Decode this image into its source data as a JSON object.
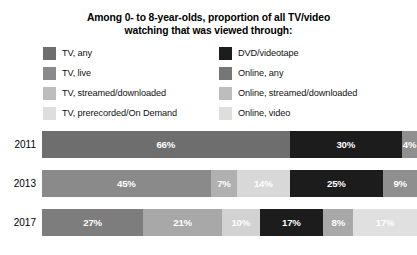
{
  "title": {
    "line1": "Among 0- to 8-year-olds, proportion of all TV/video",
    "line2": "watching that was viewed through:"
  },
  "legend": {
    "left": [
      {
        "label": "TV, any",
        "color": "#6e6e6e",
        "swatch_name": "legend-swatch-tv-any"
      },
      {
        "label": "TV, live",
        "color": "#8a8a8a",
        "swatch_name": "legend-swatch-tv-live"
      },
      {
        "label": "TV, streamed/downloaded",
        "color": "#bdbdbd",
        "swatch_name": "legend-swatch-tv-streamed"
      },
      {
        "label": "TV, prerecorded/On Demand",
        "color": "#dedede",
        "swatch_name": "legend-swatch-tv-prerecorded"
      }
    ],
    "right": [
      {
        "label": "DVD/videotape",
        "color": "#1c1c1c",
        "swatch_name": "legend-swatch-dvd"
      },
      {
        "label": "Online, any",
        "color": "#767676",
        "swatch_name": "legend-swatch-online-any"
      },
      {
        "label": "Online, streamed/downloaded",
        "color": "#bdbdbd",
        "swatch_name": "legend-swatch-online-streamed"
      },
      {
        "label": "Online, video",
        "color": "#dedede",
        "swatch_name": "legend-swatch-online-video"
      }
    ]
  },
  "chart_data": {
    "type": "bar",
    "subtype": "stacked-horizontal-100",
    "title": "Among 0- to 8-year-olds, proportion of all TV/video watching that was viewed through:",
    "xlabel": "",
    "ylabel": "",
    "xlim": [
      0,
      100
    ],
    "grid": false,
    "legend_position": "top",
    "categories": [
      "2011",
      "2013",
      "2017"
    ],
    "series": [
      {
        "name": "TV, any",
        "color": "#6e6e6e",
        "values": [
          66,
          null,
          null
        ]
      },
      {
        "name": "TV, live",
        "color": "#8a8a8a",
        "values": [
          null,
          45,
          27
        ]
      },
      {
        "name": "TV, streamed/downloaded",
        "color": "#bdbdbd",
        "values": [
          null,
          7,
          21
        ]
      },
      {
        "name": "TV, prerecorded/On Demand",
        "color": "#dedede",
        "values": [
          null,
          14,
          10
        ]
      },
      {
        "name": "DVD/videotape",
        "color": "#1c1c1c",
        "values": [
          30,
          25,
          17
        ]
      },
      {
        "name": "Online, any",
        "color": "#767676",
        "values": [
          4,
          9,
          8
        ]
      },
      {
        "name": "Online, video",
        "color": "#dedede",
        "values": [
          null,
          null,
          17
        ]
      }
    ],
    "rows": [
      {
        "year": "2011",
        "segments": [
          {
            "label": "66%",
            "value": 66,
            "color": "#6e6e6e",
            "series": "TV, any",
            "text_color": "#ffffff"
          },
          {
            "label": "30%",
            "value": 30,
            "color": "#1c1c1c",
            "series": "DVD/videotape",
            "text_color": "#ffffff"
          },
          {
            "label": "4%",
            "value": 4,
            "color": "#8f8f8f",
            "series": "Online, any",
            "text_color": "#ffffff"
          }
        ]
      },
      {
        "year": "2013",
        "segments": [
          {
            "label": "45%",
            "value": 45,
            "color": "#8a8a8a",
            "series": "TV, live",
            "text_color": "#ffffff"
          },
          {
            "label": "7%",
            "value": 7,
            "color": "#b0b0b0",
            "series": "TV, streamed/downloaded",
            "text_color": "#ffffff"
          },
          {
            "label": "14%",
            "value": 14,
            "color": "#d8d8d8",
            "series": "TV, prerecorded/On Demand",
            "text_color": "#ffffff"
          },
          {
            "label": "25%",
            "value": 25,
            "color": "#1c1c1c",
            "series": "DVD/videotape",
            "text_color": "#ffffff"
          },
          {
            "label": "9%",
            "value": 9,
            "color": "#8f8f8f",
            "series": "Online, any",
            "text_color": "#ffffff"
          }
        ]
      },
      {
        "year": "2017",
        "segments": [
          {
            "label": "27%",
            "value": 27,
            "color": "#7d7d7d",
            "series": "TV, live",
            "text_color": "#ffffff"
          },
          {
            "label": "21%",
            "value": 21,
            "color": "#a8a8a8",
            "series": "TV, streamed/downloaded",
            "text_color": "#ffffff"
          },
          {
            "label": "10%",
            "value": 10,
            "color": "#d2d2d2",
            "series": "TV, prerecorded/On Demand",
            "text_color": "#ffffff"
          },
          {
            "label": "17%",
            "value": 17,
            "color": "#1c1c1c",
            "series": "DVD/videotape",
            "text_color": "#ffffff"
          },
          {
            "label": "8%",
            "value": 8,
            "color": "#a8a8a8",
            "series": "Online, any",
            "text_color": "#ffffff"
          },
          {
            "label": "17%",
            "value": 17,
            "color": "#e0e0e0",
            "series": "Online, video",
            "text_color": "#ffffff"
          }
        ]
      }
    ]
  }
}
